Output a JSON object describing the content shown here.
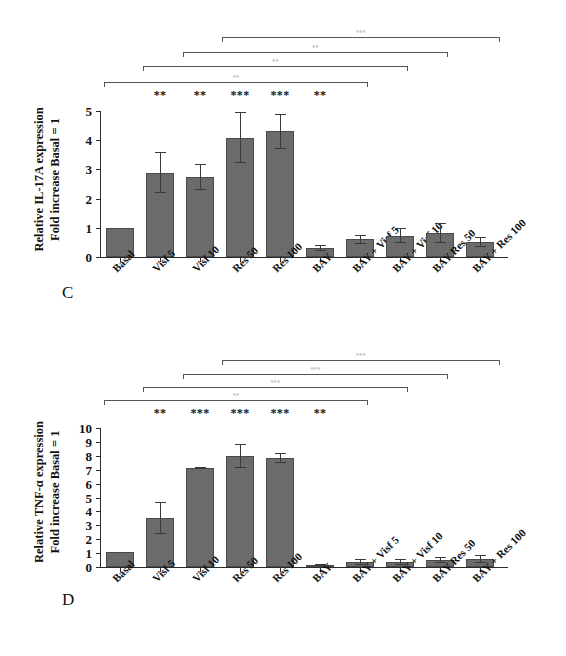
{
  "figure": {
    "background": "#ffffff",
    "bar_color": "#6b6b6b",
    "bar_edge_color": "#4a4a4a",
    "error_bar_color": "#3a3a3a"
  },
  "panels": [
    {
      "letter": "C",
      "chart_data": {
        "type": "bar",
        "title": "",
        "xlabel": "",
        "ylabel": "Relative IL-17A expression\nFold increase Basal = 1",
        "ylabel_line1": "Relative IL-17A expression",
        "ylabel_line2": "Fold increase Basal = 1",
        "ylim": [
          0,
          5
        ],
        "yticks": [
          0,
          1,
          2,
          3,
          4,
          5
        ],
        "ytick_labels": [
          "0",
          "1",
          "2",
          "3",
          "4",
          "5"
        ],
        "grid": false,
        "legend": "none",
        "categories": [
          "Basal",
          "Visf 5",
          "Visf 10",
          "Res 50",
          "Res 100",
          "BAY",
          "BAY + Visf 5",
          "BAY + Visf 10",
          "BAY Res 50",
          "BAY + Res 100"
        ],
        "values": [
          1.0,
          2.89,
          2.75,
          4.08,
          4.3,
          0.32,
          0.6,
          0.73,
          0.82,
          0.5
        ],
        "errors": [
          0.0,
          0.7,
          0.45,
          0.87,
          0.6,
          0.1,
          0.16,
          0.25,
          0.35,
          0.17
        ],
        "significance_vs_basal": [
          "",
          "**",
          "**",
          "***",
          "***",
          "**",
          "",
          "",
          "",
          ""
        ],
        "comparison_brackets": [
          {
            "label": "◦◦",
            "from": "Visf 5",
            "to": "BAY"
          },
          {
            "label": "◦◦",
            "from": "Visf 10",
            "to": "BAY + Visf 5"
          },
          {
            "label": "◦◦",
            "from": "Res 50",
            "to": "BAY + Visf 10"
          },
          {
            "label": "◦◦◦",
            "from": "Res 100",
            "to": "BAY + Res 100"
          }
        ]
      }
    },
    {
      "letter": "D",
      "chart_data": {
        "type": "bar",
        "title": "",
        "xlabel": "",
        "ylabel": "Relative TNF-α expression\nFold increase Basal = 1",
        "ylabel_line1": "Relative TNF-α expression",
        "ylabel_line2": "Fold increase Basal = 1",
        "ylim": [
          0,
          10
        ],
        "yticks": [
          0,
          1,
          2,
          3,
          4,
          5,
          6,
          7,
          8,
          9,
          10
        ],
        "ytick_labels": [
          "0",
          "1",
          "2",
          "3",
          "4",
          "5",
          "6",
          "7",
          "8",
          "9",
          "10"
        ],
        "grid": false,
        "legend": "none",
        "categories": [
          "Basal",
          "Visf 5",
          "Visf 10",
          "Res 50",
          "Res 100",
          "BAY",
          "BAY + Visf 5",
          "BAY + Visf 10",
          "BAY Res 50",
          "BAY + Res 100"
        ],
        "values": [
          1.1,
          3.5,
          7.12,
          7.98,
          7.85,
          0.15,
          0.38,
          0.35,
          0.5,
          0.55
        ],
        "errors": [
          0.0,
          1.15,
          0.08,
          0.85,
          0.35,
          0.05,
          0.22,
          0.22,
          0.2,
          0.28
        ],
        "significance_vs_basal": [
          "",
          "**",
          "***",
          "***",
          "***",
          "**",
          "",
          "",
          "",
          ""
        ],
        "comparison_brackets": [
          {
            "label": "◦◦",
            "from": "Visf 5",
            "to": "BAY"
          },
          {
            "label": "◦◦◦",
            "from": "Visf 10",
            "to": "BAY + Visf 5"
          },
          {
            "label": "◦◦◦",
            "from": "Res 50",
            "to": "BAY + Visf 10"
          },
          {
            "label": "◦◦◦",
            "from": "Res 100",
            "to": "BAY + Res 100"
          }
        ]
      }
    }
  ]
}
